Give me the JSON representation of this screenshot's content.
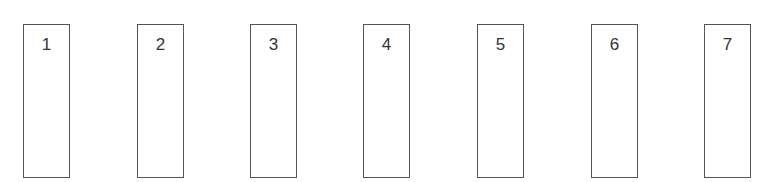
{
  "diagram": {
    "boxes": [
      {
        "label": "1",
        "left": 23
      },
      {
        "label": "2",
        "left": 137
      },
      {
        "label": "3",
        "left": 250
      },
      {
        "label": "4",
        "left": 363
      },
      {
        "label": "5",
        "left": 477
      },
      {
        "label": "6",
        "left": 591
      },
      {
        "label": "7",
        "left": 704
      }
    ],
    "border_color": "#555555"
  }
}
